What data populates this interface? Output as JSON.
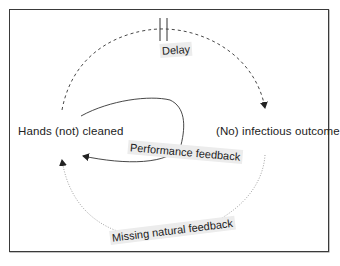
{
  "diagram": {
    "nodes": [
      {
        "id": "hands",
        "label": "Hands (not) cleaned"
      },
      {
        "id": "outcome",
        "label": "(No) infectious outcome"
      }
    ],
    "edges": [
      {
        "from": "hands",
        "to": "outcome",
        "label": "Delay",
        "style": "dashed",
        "marker": "delay-double-bar"
      },
      {
        "from": "outcome",
        "to": "hands",
        "label": "Missing natural feedback",
        "style": "dotted"
      },
      {
        "from": "hands",
        "to": "hands",
        "label": "Performance feedback",
        "style": "solid"
      }
    ]
  },
  "colors": {
    "line": "#333333",
    "dotted_line": "#8a8a8a",
    "label_bg": "#ececec",
    "frame": "#3a3a3a"
  }
}
